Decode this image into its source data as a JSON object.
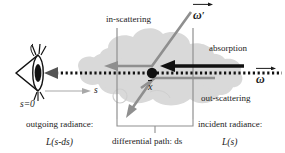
{
  "figure": {
    "background": "#ffffff"
  },
  "colors": {
    "cloud": "#d9d9d9",
    "cloud_shadow": "#cfcfcf",
    "grey_line": "#8f8f8f",
    "grey_arrow": "#8f8f8f",
    "black": "#111111",
    "thin_grey": "#a8a8a8",
    "text": "#1a1a1a"
  },
  "labels": {
    "in_scattering": "in-scattering",
    "absorption": "absorption",
    "out_scattering": "out-scattering",
    "omega_prime": "ω",
    "omega_prime_prime_mark": "′",
    "omega": "ω",
    "point_x": "x",
    "s_zero": "s=0",
    "s_axis": "s",
    "outgoing_radiance": "outgoing radiance:",
    "outgoing_radiance_value": "L(s-ds)",
    "incident_radiance": "incident radiance:",
    "incident_radiance_value": "L(s)",
    "differential_path": "differential path: ds"
  },
  "geometry": {
    "eye_center_x": 33,
    "eye_center_y": 72,
    "point_x_px": 152,
    "point_y_px": 73,
    "ray_y": 73,
    "left_vline_x": 117,
    "right_vline_x": 193,
    "bracket_y": 124,
    "bracket_left_x": 117,
    "bracket_right_x": 193
  },
  "icons": {
    "eye": "eye-icon",
    "cloud": "cloud-icon",
    "dotted_ray": "dotted-ray-icon",
    "absorption_arrow": "absorption-arrow-icon",
    "in_scattering_arrow": "in-scattering-arrow-icon",
    "out_scattering_line": "out-scattering-line-icon",
    "s_axis_arrow": "s-axis-arrow-icon",
    "bracket": "dimension-bracket-icon"
  }
}
